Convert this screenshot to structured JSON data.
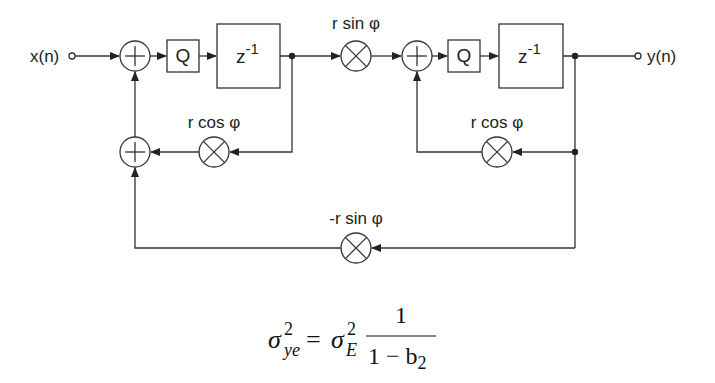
{
  "diagram": {
    "input_label": "x(n)",
    "output_label": "y(n)",
    "quantizer_label": "Q",
    "delay_label_base": "z",
    "delay_label_exp": "-1",
    "coefficients": {
      "forward": "r sin φ",
      "feedback_left": "r cos φ",
      "feedback_right": "r cos φ",
      "cross_feedback": "-r sin φ"
    }
  },
  "formula": {
    "lhs_base": "σ",
    "lhs_sup": "2",
    "lhs_sub": "ye",
    "equals": "=",
    "rhs_base": "σ",
    "rhs_sup": "2",
    "rhs_sub": "E",
    "numerator": "1",
    "denominator_left": "1 − b",
    "denominator_sub": "2"
  }
}
